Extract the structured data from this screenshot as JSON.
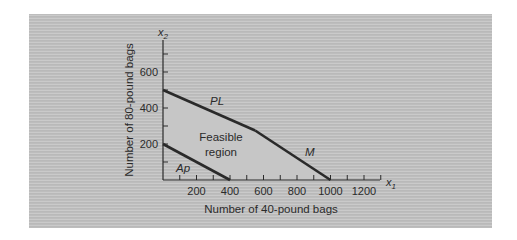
{
  "chart_data": {
    "type": "line",
    "title": "",
    "xlabel": "Number of 40-pound bags",
    "ylabel": "Number of 80-pound bags",
    "x_axis_var": "x",
    "x_axis_sub": "1",
    "y_axis_var": "x",
    "y_axis_sub": "2",
    "xlim": [
      0,
      1300
    ],
    "ylim": [
      0,
      780
    ],
    "x_ticks": [
      200,
      400,
      600,
      800,
      1000,
      1200
    ],
    "y_ticks": [
      200,
      400,
      600
    ],
    "grid": false,
    "series": [
      {
        "name": "PL",
        "points": [
          [
            0,
            500
          ],
          [
            550,
            275
          ]
        ]
      },
      {
        "name": "M",
        "points": [
          [
            550,
            275
          ],
          [
            1000,
            0
          ]
        ]
      },
      {
        "name": "Ap",
        "points": [
          [
            0,
            200
          ],
          [
            400,
            0
          ]
        ]
      }
    ],
    "feasible_region": {
      "label_line1": "Feasible",
      "label_line2": "region",
      "vertices": [
        [
          0,
          200
        ],
        [
          0,
          500
        ],
        [
          550,
          275
        ],
        [
          1000,
          0
        ],
        [
          400,
          0
        ]
      ]
    },
    "annotations": [
      {
        "text": "PL",
        "x": 250,
        "y": 430
      },
      {
        "text": "M",
        "x": 870,
        "y": 120
      },
      {
        "text": "Ap",
        "x": 120,
        "y": 50
      }
    ]
  },
  "colors": {
    "line": "#2a2a2a",
    "region": "#c6c6c6",
    "text": "#2a2a2a"
  }
}
